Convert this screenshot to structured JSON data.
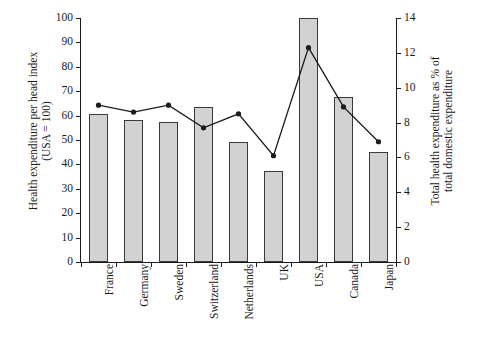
{
  "chart_data": {
    "type": "bar",
    "title": "",
    "categories": [
      "France",
      "Germany",
      "Sweden",
      "Switzerland",
      "Netherlands",
      "UK",
      "USA",
      "Canada",
      "Japan"
    ],
    "series": [
      {
        "name": "Health expenditure per head index (USA = 100)",
        "type": "bar",
        "axis": "left",
        "values": [
          60.5,
          58,
          57.5,
          63.5,
          49,
          37.5,
          100,
          67.5,
          45
        ]
      },
      {
        "name": "Total health expenditure as % of total domestic expenditure",
        "type": "line",
        "axis": "right",
        "values": [
          9.0,
          8.6,
          9.0,
          7.7,
          8.5,
          6.1,
          12.3,
          8.9,
          6.9
        ]
      }
    ],
    "ylabel": "Health expenditure per head index (USA = 100)",
    "ylabel_right": "Total health expenditure as % of total domestic expenditure",
    "xlabel": "",
    "ylim": [
      0,
      100
    ],
    "ylim_right": [
      0,
      14
    ],
    "yticks": [
      0,
      10,
      20,
      30,
      40,
      50,
      60,
      70,
      80,
      90,
      100
    ],
    "yticks_right": [
      0,
      2,
      4,
      6,
      8,
      10,
      12,
      14
    ],
    "grid": false,
    "legend": "none",
    "colors": {
      "bar_fill": "#d2d2d2",
      "bar_stroke": "#3a3a3a",
      "line": "#1a1a1a",
      "marker": "#1a1a1a",
      "axis": "#1a1a1a",
      "background": "#ffffff"
    }
  },
  "axes": {
    "left_title_line1": "Health expenditure per head index",
    "left_title_line2": "(USA = 100)",
    "right_title_line1": "Total health expenditure as % of",
    "right_title_line2": "total domestic expenditure"
  }
}
